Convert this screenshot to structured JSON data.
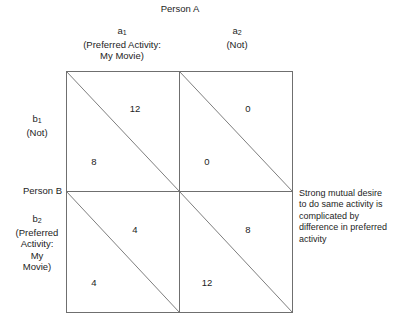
{
  "figure": {
    "title_top": "Person A",
    "title_left": "Person B",
    "background_color": "#ffffff",
    "line_color": "#6f6f6f",
    "text_color": "#1d1d1d"
  },
  "columns": [
    {
      "id": "a1",
      "label_base": "a",
      "label_sub": "1",
      "description_lines": [
        "(Preferred Activity:",
        "My Movie)"
      ]
    },
    {
      "id": "a2",
      "label_base": "a",
      "label_sub": "2",
      "description_lines": [
        "(Not)"
      ]
    }
  ],
  "rows": [
    {
      "id": "b1",
      "label_base": "b",
      "label_sub": "1",
      "description_lines": [
        "(Not)"
      ]
    },
    {
      "id": "b2",
      "label_base": "b",
      "label_sub": "2",
      "description_lines": [
        "(Preferred",
        "Activity:",
        "My",
        "Movie)"
      ]
    }
  ],
  "cells": [
    {
      "id": "cell-a1-b1",
      "row": "b1",
      "column": "a1",
      "upper_right_payoff": "12",
      "lower_left_payoff": "8"
    },
    {
      "id": "cell-a2-b1",
      "row": "b1",
      "column": "a2",
      "upper_right_payoff": "0",
      "lower_left_payoff": "0"
    },
    {
      "id": "cell-a1-b2",
      "row": "b2",
      "column": "a1",
      "upper_right_payoff": "4",
      "lower_left_payoff": "4"
    },
    {
      "id": "cell-a2-b2",
      "row": "b2",
      "column": "a2",
      "upper_right_payoff": "8",
      "lower_left_payoff": "12"
    }
  ],
  "annotation": {
    "lines": [
      "Strong mutual desire",
      "to do same activity is",
      "complicated by",
      "difference in preferred",
      "activity"
    ],
    "text": "Strong mutual desire to do same activity is complicated by difference in preferred activity"
  }
}
